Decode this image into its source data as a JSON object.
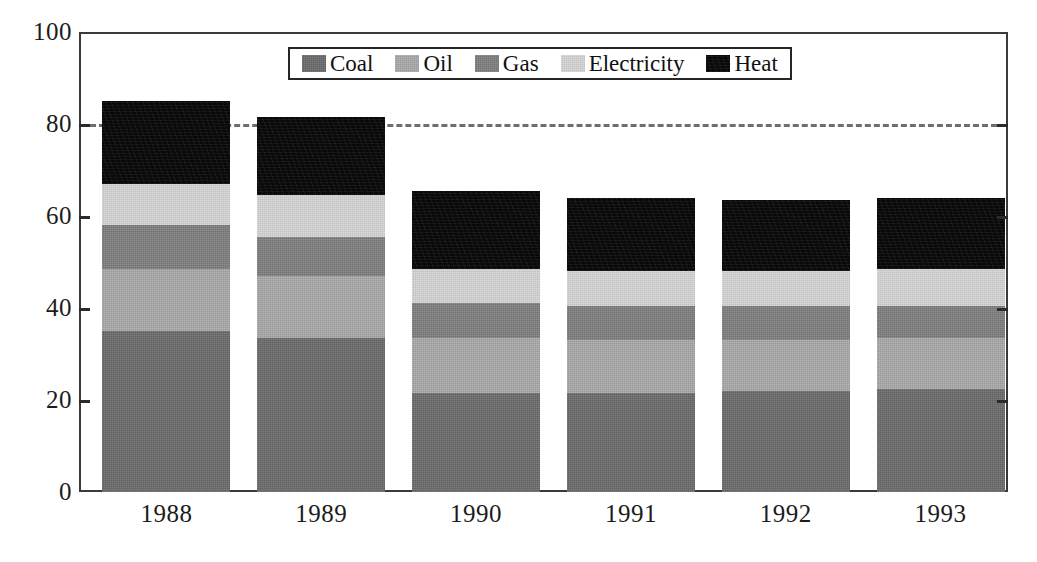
{
  "chart_data": {
    "type": "bar",
    "subtype": "stacked-bar",
    "title": "",
    "xlabel": "",
    "ylabel": "",
    "ylim": [
      0,
      100
    ],
    "yticks": [
      0,
      20,
      40,
      60,
      80,
      100
    ],
    "ytick_labels": [
      "0",
      "20",
      "40",
      "60",
      "80",
      "100"
    ],
    "grid": false,
    "legend_position": "top-center",
    "reference_line": {
      "y": 80,
      "style": "dashed",
      "color": "#6e6e6e"
    },
    "categories": [
      "1988",
      "1989",
      "1990",
      "1991",
      "1992",
      "1993"
    ],
    "series": [
      {
        "name": "Coal",
        "color": "#6b6b6b",
        "values": [
          35.0,
          33.5,
          21.5,
          21.5,
          22.0,
          22.5
        ]
      },
      {
        "name": "Oil",
        "color": "#a8a8a8",
        "values": [
          13.5,
          13.5,
          12.0,
          11.5,
          11.0,
          11.0
        ]
      },
      {
        "name": "Gas",
        "color": "#7e7e7e",
        "values": [
          9.5,
          8.5,
          7.5,
          7.5,
          7.5,
          7.0
        ]
      },
      {
        "name": "Electricity",
        "color": "#d2d2d2",
        "values": [
          9.0,
          9.0,
          7.5,
          7.5,
          7.5,
          8.0
        ]
      },
      {
        "name": "Heat",
        "color": "#0b0b0b",
        "values": [
          18.0,
          17.0,
          17.0,
          16.0,
          15.5,
          15.5
        ]
      }
    ],
    "totals": [
      85.0,
      81.5,
      65.5,
      64.0,
      63.5,
      64.0
    ]
  },
  "legend": {
    "items": [
      {
        "label": "Coal",
        "swatch": "legend-swatch-coal"
      },
      {
        "label": "Oil",
        "swatch": "legend-swatch-oil"
      },
      {
        "label": "Gas",
        "swatch": "legend-swatch-gas"
      },
      {
        "label": "Electricity",
        "swatch": "legend-swatch-electricity"
      },
      {
        "label": "Heat",
        "swatch": "legend-swatch-heat"
      }
    ]
  },
  "axes": {
    "y_tick_labels": [
      "100",
      "80",
      "60",
      "40",
      "20",
      "0"
    ],
    "x_tick_labels": [
      "1988",
      "1989",
      "1990",
      "1991",
      "1992",
      "1993"
    ]
  }
}
